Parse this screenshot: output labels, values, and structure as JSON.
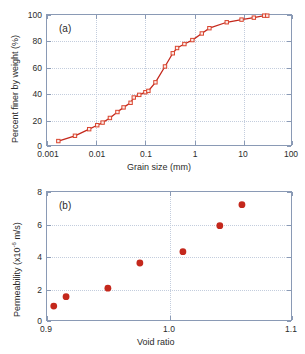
{
  "figure": {
    "background": "#ffffff",
    "accent_red": "#c4281c",
    "frame_color": "#8a9ab5",
    "grid_color": "#c3cddd"
  },
  "panel_a": {
    "label": "(a)",
    "xlabel": "Grain size (mm)",
    "ylabel": "Percent finer by weight (%)",
    "x_ticks": [
      "0.001",
      "0.01",
      "0.1",
      "1",
      "10",
      "100"
    ],
    "y_ticks": [
      "0",
      "20",
      "40",
      "60",
      "80",
      "100"
    ]
  },
  "panel_b": {
    "label": "(b)",
    "xlabel": "Void ratio",
    "ylabel_prefix": "Permeability (x10",
    "ylabel_sup": "-6",
    "ylabel_suffix": " m/s)",
    "x_ticks": [
      "0.9",
      "1.0",
      "1.1"
    ],
    "y_ticks": [
      "0",
      "2",
      "4",
      "6",
      "8"
    ]
  },
  "chart_data": [
    {
      "type": "line",
      "id": "panel-a",
      "title": "(a)",
      "xlabel": "Grain size (mm)",
      "ylabel": "Percent finer by weight (%)",
      "xscale": "log",
      "xlim": [
        0.001,
        100
      ],
      "ylim": [
        0,
        100
      ],
      "grid": true,
      "marker": "open-square",
      "color": "#c4281c",
      "x": [
        0.0017,
        0.0037,
        0.0072,
        0.0105,
        0.0135,
        0.019,
        0.027,
        0.036,
        0.05,
        0.058,
        0.075,
        0.1,
        0.115,
        0.16,
        0.25,
        0.36,
        0.44,
        0.62,
        0.9,
        1.4,
        2.0,
        4.5,
        9.0,
        16.0,
        26.0,
        30.0
      ],
      "y": [
        4.5,
        8.5,
        13.5,
        16.5,
        18.5,
        22.0,
        26.5,
        30.0,
        33.5,
        37.5,
        39.5,
        41.5,
        42.5,
        49.0,
        61.0,
        71.0,
        75.0,
        78.0,
        81.0,
        86.0,
        90.0,
        94.5,
        96.5,
        98.0,
        99.5,
        99.5
      ]
    },
    {
      "type": "scatter",
      "id": "panel-b",
      "title": "(b)",
      "xlabel": "Void ratio",
      "ylabel": "Permeability (x10-6 m/s)",
      "xscale": "linear",
      "xlim": [
        0.9,
        1.1
      ],
      "ylim": [
        0,
        8
      ],
      "grid": true,
      "marker": "filled-circle",
      "color": "#c4281c",
      "x": [
        0.9055,
        0.9155,
        0.9495,
        0.9755,
        1.0105,
        1.0405,
        1.0585
      ],
      "y": [
        0.98,
        1.56,
        2.08,
        3.63,
        4.33,
        5.93,
        7.22
      ]
    }
  ]
}
